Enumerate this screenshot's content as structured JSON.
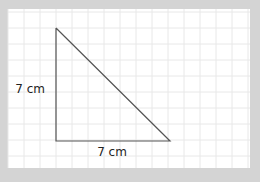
{
  "diagram": {
    "background": "#d4d4d4",
    "paper": "#ffffff",
    "grid_color": "#e8e8e8",
    "line_color": "#555555",
    "grid_spacing": 16,
    "triangle": {
      "vertices": [
        [
          56,
          28
        ],
        [
          56,
          141
        ],
        [
          170,
          141
        ]
      ],
      "right_angle_at": "bottom-left"
    },
    "labels": {
      "left_side": "7 cm",
      "bottom_side": "7 cm"
    }
  }
}
